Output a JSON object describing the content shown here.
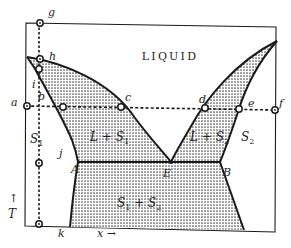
{
  "diagram": {
    "title": "LIQUID",
    "region_labels": {
      "liquid": "LIQUID",
      "l_s1": "L + S",
      "l_s1_sub": "1",
      "l_s2": "L + S",
      "l_s2_sub": "2",
      "s1": "S",
      "s1_sub": "1",
      "s2": "S",
      "s2_sub": "2",
      "s1_s2_a": "S",
      "s1_s2_a_sub": "1",
      "s1_s2_plus": " + S",
      "s1_s2_b_sub": "2"
    },
    "point_labels": {
      "g": "g",
      "h": "h",
      "i": "i",
      "a": "a",
      "b": "b",
      "c": "c",
      "d": "d",
      "e": "e",
      "f": "f",
      "j": "j",
      "k": "k",
      "A": "A",
      "E": "E",
      "B": "B"
    },
    "axes": {
      "y_arrow": "↑",
      "y_label": "T",
      "x_label": "x →"
    },
    "colors": {
      "line": "#1a1a1a",
      "stipple": "#555555",
      "background": "#ffffff"
    }
  }
}
